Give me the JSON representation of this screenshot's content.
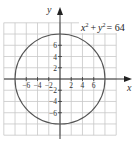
{
  "chart_data": {
    "type": "line",
    "title": "",
    "equation": "x² + y² = 64",
    "equation_parts": {
      "x": "x",
      "exp": "2",
      "plus": "+",
      "y": "y",
      "eq": "= 64"
    },
    "curve": {
      "shape": "circle",
      "center": [
        0,
        0
      ],
      "radius": 8
    },
    "xlabel": "x",
    "ylabel": "y",
    "xlim": [
      -10,
      10
    ],
    "ylim": [
      -10,
      10
    ],
    "grid": true,
    "grid_step": 2,
    "x_tick_labels": [
      "−6",
      "−4",
      "−2",
      "2",
      "4",
      "6"
    ],
    "x_tick_values": [
      -6,
      -4,
      -2,
      2,
      4,
      6
    ],
    "y_tick_labels": [
      "6",
      "4",
      "2",
      "−2",
      "−4",
      "−6"
    ],
    "y_tick_values": [
      6,
      4,
      2,
      -2,
      -4,
      -6
    ]
  },
  "colors": {
    "grid": "#c8c8c8",
    "axis": "#333333",
    "curve": "#555555"
  }
}
